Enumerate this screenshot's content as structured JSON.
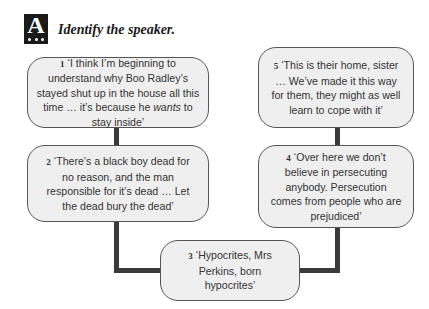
{
  "header": {
    "badge_letter": "A",
    "title": "Identify the speaker."
  },
  "quotes": [
    {
      "number": "1",
      "text_before": "‘I think I’m beginning to understand why Boo Radley’s stayed shut up in the house all this time … it’s because he ",
      "emphasis": "wants",
      "text_after": " to stay inside’"
    },
    {
      "number": "2",
      "text": "‘There’s a black boy dead for no reason, and the man responsible for it’s dead … Let the dead bury the dead’"
    },
    {
      "number": "3",
      "text": "‘Hypocrites, Mrs Perkins, born hypocrites’"
    },
    {
      "number": "4",
      "text": "‘Over here we don’t believe in persecuting anybody. Persecution comes from people who are prejudiced’"
    },
    {
      "number": "5",
      "text": "‘This is their home, sister … We’ve made it this way for them, they might as well learn to cope with it’"
    }
  ],
  "colors": {
    "box_fill": "#efefef",
    "box_border": "#555555",
    "connector": "#3a3a3a",
    "badge": "#1a1a1a"
  }
}
